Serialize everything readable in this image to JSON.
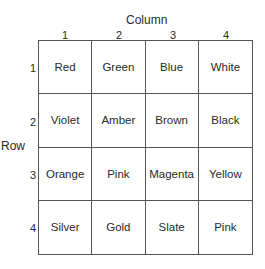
{
  "axes": {
    "column_title": "Column",
    "row_title": "Row",
    "column_labels": [
      "1",
      "2",
      "3",
      "4"
    ],
    "row_labels": [
      "1",
      "2",
      "3",
      "4"
    ]
  },
  "grid": {
    "rows": [
      [
        "Red",
        "Green",
        "Blue",
        "White"
      ],
      [
        "Violet",
        "Amber",
        "Brown",
        "Black"
      ],
      [
        "Orange",
        "Pink",
        "Magenta",
        "Yellow"
      ],
      [
        "Silver",
        "Gold",
        "Slate",
        "Pink"
      ]
    ]
  }
}
